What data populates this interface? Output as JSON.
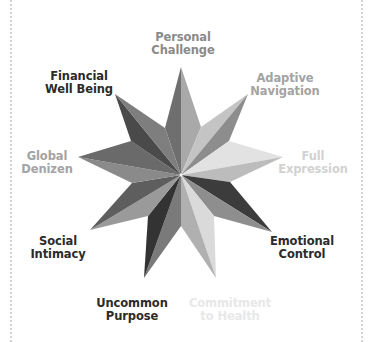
{
  "diagram": {
    "type": "star",
    "points": 9,
    "center": [
      181,
      175
    ],
    "labels": [
      {
        "id": "personal-challenge",
        "line1": "Personal",
        "line2": "Challenge",
        "color": "#8a8a8a",
        "x": 183,
        "y": 31
      },
      {
        "id": "adaptive-navigation",
        "line1": "Adaptive",
        "line2": "Navigation",
        "color": "#a3a3a3",
        "x": 285,
        "y": 73
      },
      {
        "id": "full-expression",
        "line1": "Full",
        "line2": "Expression",
        "color": "#d2d2d2",
        "x": 313,
        "y": 151
      },
      {
        "id": "emotional-control",
        "line1": "Emotional",
        "line2": "Control",
        "color": "#2b2b2b",
        "x": 302,
        "y": 235
      },
      {
        "id": "commitment-to-health",
        "line1": "Commitment",
        "line2": "to Health",
        "color": "#e8e8e8",
        "x": 230,
        "y": 297
      },
      {
        "id": "uncommon-purpose",
        "line1": "Uncommon",
        "line2": "Purpose",
        "color": "#2b2b2b",
        "x": 132,
        "y": 297
      },
      {
        "id": "social-intimacy",
        "line1": "Social",
        "line2": "Intimacy",
        "color": "#2b2b2b",
        "x": 59,
        "y": 235
      },
      {
        "id": "global-denizen",
        "line1": "Global",
        "line2": "Denizen",
        "color": "#a3a3a3",
        "x": 48,
        "y": 151
      },
      {
        "id": "financial-well-being",
        "line1": "Financial",
        "line2": "Well Being",
        "color": "#2b2b2b",
        "x": 79,
        "y": 73
      }
    ]
  }
}
